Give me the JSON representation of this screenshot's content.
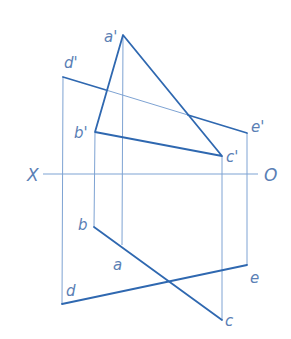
{
  "diagram": {
    "type": "orthographic-projection",
    "colors": {
      "thick_line": "#2f68b0",
      "thin_line": "#7ea3d3",
      "label": "#5b7fb5",
      "background": "#ffffff"
    },
    "axis": {
      "left_label": "X",
      "right_label": "O",
      "y": 174,
      "x1": 43,
      "x2": 258
    },
    "points_front": {
      "a": {
        "label": "a'",
        "x": 123,
        "y": 35
      },
      "b": {
        "label": "b'",
        "x": 95,
        "y": 132
      },
      "c": {
        "label": "c'",
        "x": 222,
        "y": 156
      },
      "d": {
        "label": "d'",
        "x": 63,
        "y": 77
      },
      "e": {
        "label": "e'",
        "x": 247,
        "y": 133
      }
    },
    "points_top": {
      "a": {
        "label": "a",
        "x": 122,
        "y": 245
      },
      "b": {
        "label": "b",
        "x": 94,
        "y": 227
      },
      "c": {
        "label": "c",
        "x": 222,
        "y": 320
      },
      "d": {
        "label": "d",
        "x": 62,
        "y": 304
      },
      "e": {
        "label": "e",
        "x": 247,
        "y": 265
      }
    }
  }
}
